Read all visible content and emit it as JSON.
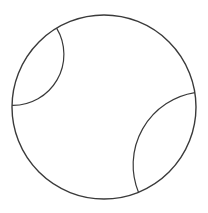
{
  "diagram": {
    "boundary": {
      "name": "unit-circle-boundary"
    },
    "geodesics": [
      {
        "name": "geodesic-upper-left",
        "from_angle_deg": 121,
        "to_angle_deg": 179
      },
      {
        "name": "geodesic-lower-right",
        "from_angle_deg": 9,
        "to_angle_deg": -68
      }
    ],
    "colors": {
      "stroke": "#3a3a3a",
      "background": "#ffffff"
    }
  }
}
